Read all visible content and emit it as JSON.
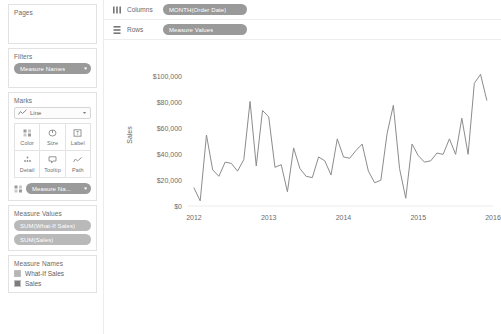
{
  "sidebar": {
    "pages": {
      "title": "Pages"
    },
    "filters": {
      "title": "Filters",
      "pills": [
        {
          "label": "Measure Names",
          "icon": "sort-icon"
        }
      ]
    },
    "marks": {
      "title": "Marks",
      "mark_type": "Line",
      "mark_type_icon": "line-chart-icon",
      "buttons": [
        {
          "label": "Color",
          "icon": "color-palette-icon"
        },
        {
          "label": "Size",
          "icon": "size-icon"
        },
        {
          "label": "Label",
          "icon": "label-icon"
        },
        {
          "label": "Detail",
          "icon": "detail-icon"
        },
        {
          "label": "Tooltip",
          "icon": "tooltip-icon"
        },
        {
          "label": "Path",
          "icon": "path-icon"
        }
      ],
      "encoding_pill": {
        "label": "Measure Na...",
        "icon": "color-palette-icon"
      }
    },
    "measure_values": {
      "title": "Measure Values",
      "pills": [
        {
          "label": "SUM(What-If Sales)"
        },
        {
          "label": "SUM(Sales)"
        }
      ]
    },
    "legend": {
      "title": "Measure Names",
      "items": [
        {
          "label": "What-If Sales",
          "color": "#b5b5b5"
        },
        {
          "label": "Sales",
          "color": "#7d7d7d"
        }
      ]
    }
  },
  "shelves": [
    {
      "name": "Columns",
      "icon": "columns-icon",
      "pill": {
        "label": "MONTH(Order Date)",
        "prefix": "+"
      }
    },
    {
      "name": "Rows",
      "icon": "rows-icon",
      "pill": {
        "label": "Measure Values",
        "prefix": ""
      }
    }
  ],
  "colors": {
    "line": "#8c8c8c",
    "pill": "#9a9a9a",
    "text": "#666666",
    "border": "#e2e2e2"
  },
  "chart_data": {
    "type": "line",
    "title": "",
    "xlabel": "",
    "ylabel": "Sales",
    "ylim": [
      0,
      110000
    ],
    "yticks": [
      0,
      20000,
      40000,
      60000,
      80000,
      100000
    ],
    "ytick_labels": [
      "$0",
      "$20,000",
      "$40,000",
      "$60,000",
      "$80,000",
      "$100,000"
    ],
    "xticks": [
      2012,
      2013,
      2014,
      2015,
      2016
    ],
    "xtick_labels": [
      "2012",
      "2013",
      "2014",
      "2015",
      "2016"
    ],
    "xlim": [
      2011.92,
      2016.0
    ],
    "grid": false,
    "legend_position": "left-sidebar",
    "series": [
      {
        "name": "Sales",
        "color": "#8c8c8c",
        "x": [
          2012.0,
          2012.083,
          2012.167,
          2012.25,
          2012.333,
          2012.417,
          2012.5,
          2012.583,
          2012.667,
          2012.75,
          2012.833,
          2012.917,
          2013.0,
          2013.083,
          2013.167,
          2013.25,
          2013.333,
          2013.417,
          2013.5,
          2013.583,
          2013.667,
          2013.75,
          2013.833,
          2013.917,
          2014.0,
          2014.083,
          2014.167,
          2014.25,
          2014.333,
          2014.417,
          2014.5,
          2014.583,
          2014.667,
          2014.75,
          2014.833,
          2014.917,
          2015.0,
          2015.083,
          2015.167,
          2015.25,
          2015.333,
          2015.417,
          2015.5,
          2015.583,
          2015.667,
          2015.75,
          2015.833,
          2015.917
        ],
        "values": [
          14000,
          4000,
          55000,
          28000,
          23000,
          34000,
          33000,
          27000,
          36000,
          81000,
          31000,
          74000,
          69000,
          30000,
          32000,
          11000,
          45000,
          29000,
          23000,
          22000,
          38000,
          35000,
          24000,
          52000,
          38000,
          37000,
          43000,
          48000,
          27000,
          18000,
          20000,
          56000,
          78000,
          29000,
          6000,
          48000,
          39000,
          34000,
          35000,
          41000,
          40000,
          52000,
          40000,
          68000,
          40000,
          95000,
          102000,
          82000
        ]
      }
    ]
  }
}
